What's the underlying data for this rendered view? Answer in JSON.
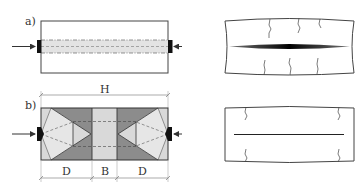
{
  "figure": {
    "panel_a": {
      "label": "a)",
      "description": "specimen loaded through narrow central plates with dashed central stripe"
    },
    "panel_b": {
      "label": "b)",
      "dimension_total": "H",
      "dimension_segments": [
        "D",
        "B",
        "D"
      ]
    },
    "colors": {
      "outline": "#333333",
      "dark_zone": "#8a8a8a",
      "light_zone": "#d6d6d6",
      "stripe": "#e3e3e3",
      "plate": "#111111"
    },
    "icons": {
      "load_arrow": "arrow-right-icon",
      "load_plate": "plate-icon"
    }
  }
}
